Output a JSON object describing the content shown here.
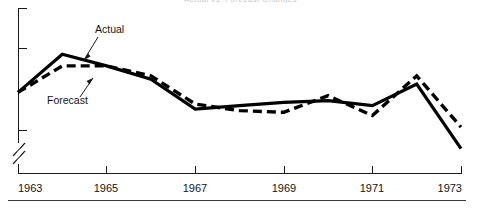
{
  "figure": {
    "title_clipped": "Actual vs. Forecast Changes",
    "annotations": [
      {
        "id": "actual",
        "label": "Actual"
      },
      {
        "id": "forecast",
        "label": "Forecast"
      }
    ],
    "axis_break_symbol": "//",
    "footer_rule": true
  },
  "chart_data": {
    "type": "line",
    "title": "",
    "xlabel": "",
    "ylabel": "",
    "grid": false,
    "legend_position": "inline-annotations",
    "x_tick_labels": [
      "1963",
      "1965",
      "1967",
      "1969",
      "1971",
      "1973"
    ],
    "x_tick_years": [
      1963,
      1965,
      1967,
      1969,
      1971,
      1973
    ],
    "xlim": [
      1963,
      1973
    ],
    "ylim": [
      0,
      100
    ],
    "y_axis_has_break": true,
    "y_tick_count": 3,
    "x": [
      1963,
      1964,
      1965,
      1966,
      1967,
      1968,
      1969,
      1970,
      1971,
      1972,
      1973
    ],
    "series": [
      {
        "name": "Actual",
        "style": "solid",
        "color": "#000000",
        "values": [
          52,
          75,
          68,
          60,
          42,
          44,
          46,
          47,
          44,
          57,
          18
        ]
      },
      {
        "name": "Forecast",
        "style": "dashed",
        "color": "#000000",
        "values": [
          52,
          68,
          68,
          62,
          45,
          41,
          40,
          50,
          38,
          62,
          31
        ]
      }
    ]
  }
}
